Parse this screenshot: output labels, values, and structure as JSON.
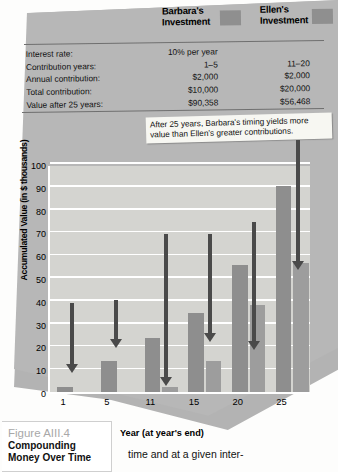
{
  "legend": {
    "barbara": "Barbara's\nInvestment",
    "barbara_line1": "Barbara's",
    "barbara_line2": "Investment",
    "ellen_line1": "Ellen's",
    "ellen_line2": "Investment",
    "swatch_color": "#8f8f8f"
  },
  "table": {
    "rows": [
      {
        "label": "Interest rate:",
        "barbara": "10% per year",
        "ellen": ""
      },
      {
        "label": "Contribution years:",
        "barbara": "1–5",
        "ellen": "11–20"
      },
      {
        "label": "Annual contribution:",
        "barbara": "$2,000",
        "ellen": "$2,000"
      },
      {
        "label": "Total contribution:",
        "barbara": "$10,000",
        "ellen": "$20,000"
      },
      {
        "label": "Value after 25 years:",
        "barbara": "$90,358",
        "ellen": "$56,468"
      }
    ]
  },
  "callouts": {
    "top": "After 25 years, Barbara's timing yields more value than Ellen's greater contributions.",
    "ellen": "Ellen invests $2,000 annually in Years 11 to 20.",
    "barbara": "Barbara invests $2,000 annually in Years 1 to 5."
  },
  "caption": {
    "figure_number": "Figure AIII.4",
    "title_line1": "Compounding",
    "title_line2": "Money Over Time"
  },
  "body_text": "time and at a given inter-",
  "chart_data": {
    "type": "bar",
    "title": "Compounding Money Over Time",
    "xlabel": "Year (at year's end)",
    "ylabel": "Accumulated Value (in $ thousands)",
    "categories": [
      "1",
      "5",
      "11",
      "15",
      "20",
      "25"
    ],
    "ylim": [
      0,
      100
    ],
    "yticks": [
      0,
      10,
      20,
      30,
      40,
      50,
      60,
      70,
      80,
      90,
      100
    ],
    "grid": true,
    "legend_position": "top",
    "series": [
      {
        "name": "Barbara's Investment",
        "color": "#8e8e8e",
        "values": [
          2.2,
          13.4,
          23.5,
          34.5,
          55.6,
          90.4
        ]
      },
      {
        "name": "Ellen's Investment",
        "color": "#9d9d9d",
        "values": [
          0,
          0,
          2.2,
          13.4,
          38.3,
          56.5
        ]
      }
    ],
    "annotations": [
      "Barbara invests $2,000 annually in Years 1 to 5.",
      "Ellen invests $2,000 annually in Years 11 to 20.",
      "After 25 years, Barbara's timing yields more value than Ellen's greater contributions."
    ]
  }
}
